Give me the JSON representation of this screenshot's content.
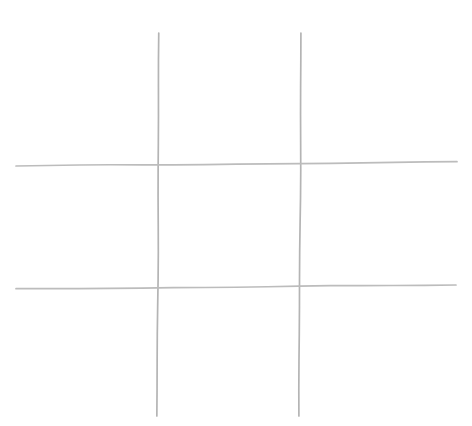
{
  "image": {
    "kind": "hand-drawn-tic-tac-toe-grid",
    "title": "Tic Tac Toe Grid",
    "description": "A hand-drawn noughts-and-crosses grid: two near-vertical and two near-horizontal faint grey lines on plain white paper, forming nine empty cells. No marks, letters or numbers are present.",
    "width": 472,
    "height": 426,
    "background_color": "#ffffff",
    "line_color": "#b9b9b9",
    "line_color_dark": "#a8a8a8",
    "stroke_width": 1.7
  },
  "grid": {
    "rows": 3,
    "columns": 3,
    "lines": [
      {
        "name": "vertical-line-left",
        "orientation": "vertical",
        "x1": 159,
        "y1": 33,
        "x2": 157,
        "y2": 416,
        "stroke_width": 1.7,
        "color": "#b4b4b4"
      },
      {
        "name": "vertical-line-right",
        "orientation": "vertical",
        "x1": 301,
        "y1": 33,
        "x2": 299,
        "y2": 416,
        "stroke_width": 1.7,
        "color": "#b4b4b4"
      },
      {
        "name": "horizontal-line-top",
        "orientation": "horizontal",
        "x1": 16,
        "y1": 166,
        "x2": 457,
        "y2": 162,
        "stroke_width": 1.7,
        "color": "#bcbcbc"
      },
      {
        "name": "horizontal-line-bottom",
        "orientation": "horizontal",
        "x1": 16,
        "y1": 289,
        "x2": 456,
        "y2": 285,
        "stroke_width": 1.7,
        "color": "#bcbcbc"
      }
    ],
    "intersections": [
      {
        "name": "intersection-top-left",
        "x": 158,
        "y": 164
      },
      {
        "name": "intersection-top-right",
        "x": 300,
        "y": 163
      },
      {
        "name": "intersection-bottom-left",
        "x": 158,
        "y": 287
      },
      {
        "name": "intersection-bottom-right",
        "x": 300,
        "y": 286
      }
    ],
    "cells": [
      {
        "name": "cell-top-left",
        "row": 1,
        "col": 1,
        "mark": "",
        "x": 16,
        "y": 12,
        "w": 142,
        "h": 152
      },
      {
        "name": "cell-top-center",
        "row": 1,
        "col": 2,
        "mark": "",
        "x": 158,
        "y": 12,
        "w": 142,
        "h": 152
      },
      {
        "name": "cell-top-right",
        "row": 1,
        "col": 3,
        "mark": "",
        "x": 300,
        "y": 12,
        "w": 157,
        "h": 152
      },
      {
        "name": "cell-middle-left",
        "row": 2,
        "col": 1,
        "mark": "",
        "x": 16,
        "y": 164,
        "w": 142,
        "h": 123
      },
      {
        "name": "cell-middle-center",
        "row": 2,
        "col": 2,
        "mark": "",
        "x": 158,
        "y": 164,
        "w": 142,
        "h": 123
      },
      {
        "name": "cell-middle-right",
        "row": 2,
        "col": 3,
        "mark": "",
        "x": 300,
        "y": 164,
        "w": 157,
        "h": 123
      },
      {
        "name": "cell-bottom-left",
        "row": 3,
        "col": 1,
        "mark": "",
        "x": 16,
        "y": 287,
        "w": 142,
        "h": 129
      },
      {
        "name": "cell-bottom-center",
        "row": 3,
        "col": 2,
        "mark": "",
        "x": 158,
        "y": 287,
        "w": 142,
        "h": 129
      },
      {
        "name": "cell-bottom-right",
        "row": 3,
        "col": 3,
        "mark": "",
        "x": 300,
        "y": 287,
        "w": 157,
        "h": 129
      }
    ]
  }
}
